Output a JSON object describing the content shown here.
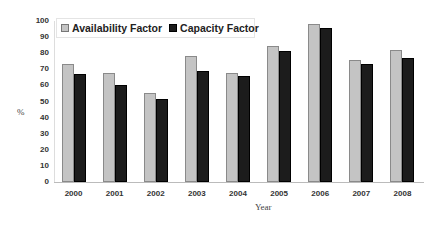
{
  "chart_data": {
    "type": "bar",
    "title": "",
    "xlabel": "Year",
    "ylabel": "%",
    "ylim": [
      0,
      100
    ],
    "yticks": [
      0,
      10,
      20,
      30,
      40,
      50,
      60,
      70,
      80,
      90,
      100
    ],
    "grid": false,
    "legend_position": "top-left-inside",
    "categories": [
      "2000",
      "2001",
      "2002",
      "2003",
      "2004",
      "2005",
      "2006",
      "2007",
      "2008"
    ],
    "series": [
      {
        "name": "Availability Factor",
        "color": "#c4c4c4",
        "values": [
          73,
          67.5,
          55,
          78,
          68,
          84.5,
          98,
          75.5,
          82
        ]
      },
      {
        "name": "Capacity Factor",
        "color": "#1c1c1c",
        "values": [
          67,
          60,
          51.5,
          69,
          66,
          81.5,
          95.5,
          73.5,
          77
        ]
      }
    ]
  }
}
